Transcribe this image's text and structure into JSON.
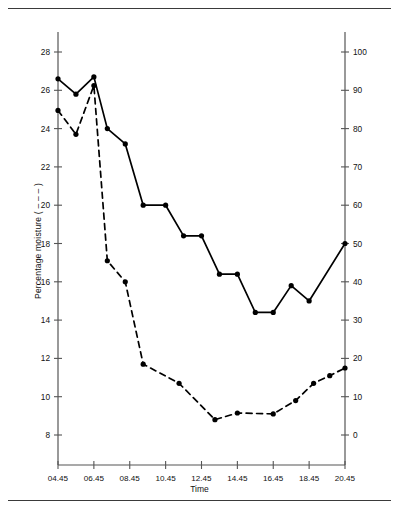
{
  "chart_data": {
    "type": "line",
    "title": "",
    "xlabel": "Time",
    "grid": false,
    "legend_position": "axis-titles",
    "x_ticklabels": [
      "04.45",
      "06.45",
      "08.45",
      "10.45",
      "12.45",
      "14.45",
      "16.45",
      "18.45",
      "20.45"
    ],
    "x_tickvalues": [
      4.75,
      6.75,
      8.75,
      10.75,
      12.75,
      14.75,
      16.75,
      18.75,
      20.75
    ],
    "xlim": [
      4.75,
      20.75
    ],
    "axes": [
      {
        "id": "left",
        "label": "Percentage moisture  ( – – – )",
        "ylabel": "Percentage moisture",
        "ylim": [
          7.0,
          29.0
        ],
        "ticks": [
          8,
          10,
          12,
          14,
          16,
          18,
          20,
          22,
          24,
          26,
          28
        ],
        "ticklabels": [
          "8",
          "10",
          "12",
          "14",
          "16",
          "18",
          "20",
          "22",
          "24",
          "26",
          "28"
        ]
      },
      {
        "id": "right",
        "label": "Relative humidity  ( —— )",
        "ylabel": "Relative humidity",
        "ylim": [
          -5.0,
          105.0
        ],
        "ticks": [
          0,
          10,
          20,
          30,
          40,
          50,
          60,
          70,
          80,
          90,
          100
        ],
        "ticklabels": [
          "0",
          "10",
          "20",
          "30",
          "40",
          "50",
          "60",
          "70",
          "80",
          "90",
          "100"
        ]
      }
    ],
    "series": [
      {
        "name": "Relative humidity",
        "axis": "right",
        "style": "solid",
        "marker": "filled-circle",
        "color": "#000000",
        "x": [
          4.75,
          5.75,
          6.75,
          7.5,
          8.5,
          9.5,
          10.75,
          11.75,
          12.75,
          13.75,
          14.75,
          15.75,
          16.75,
          17.75,
          18.75,
          20.75
        ],
        "values": [
          93.0,
          89.0,
          93.5,
          80.0,
          76.0,
          60.0,
          60.0,
          52.0,
          52.0,
          42.0,
          42.0,
          32.0,
          32.0,
          39.0,
          35.0,
          50.0
        ]
      },
      {
        "name": "Percentage moisture",
        "axis": "left",
        "style": "dashed",
        "marker": "filled-circle",
        "color": "#000000",
        "x": [
          4.75,
          5.75,
          6.75,
          7.5,
          8.5,
          9.5,
          11.5,
          13.5,
          14.75,
          16.75,
          18.0,
          19.0,
          19.9,
          20.75
        ],
        "values": [
          24.95,
          23.7,
          26.25,
          17.1,
          16.0,
          11.7,
          10.7,
          8.8,
          9.15,
          9.1,
          9.8,
          10.7,
          11.1,
          11.5
        ]
      }
    ],
    "annotations": []
  }
}
